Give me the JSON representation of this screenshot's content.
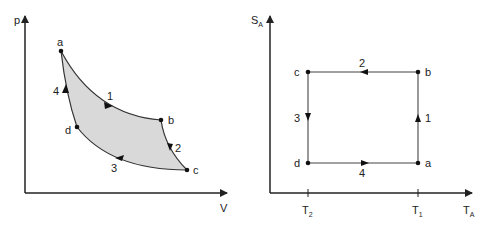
{
  "left_diagram": {
    "title": "p-V diagram",
    "y_axis_label": "p",
    "x_axis_label": "V",
    "points": {
      "a": {
        "label": "a"
      },
      "b": {
        "label": "b"
      },
      "c": {
        "label": "c"
      },
      "d": {
        "label": "d"
      }
    },
    "processes": [
      {
        "label": "1",
        "from": "a",
        "to": "b"
      },
      {
        "label": "2",
        "from": "b",
        "to": "c"
      },
      {
        "label": "3",
        "from": "c",
        "to": "d"
      },
      {
        "label": "4",
        "from": "d",
        "to": "a"
      }
    ],
    "fill_color": "#d9d9d9"
  },
  "right_diagram": {
    "title": "T-S diagram",
    "y_axis_label": "S",
    "y_axis_subscript": "A",
    "x_axis_label": "T",
    "x_axis_subscript": "A",
    "ticks": [
      {
        "label": "T",
        "subscript": "2"
      },
      {
        "label": "T",
        "subscript": "1"
      }
    ],
    "points": {
      "a": {
        "label": "a"
      },
      "b": {
        "label": "b"
      },
      "c": {
        "label": "c"
      },
      "d": {
        "label": "d"
      }
    },
    "processes": [
      {
        "label": "1",
        "from": "a",
        "to": "b"
      },
      {
        "label": "2",
        "from": "b",
        "to": "c"
      },
      {
        "label": "3",
        "from": "c",
        "to": "d"
      },
      {
        "label": "4",
        "from": "d",
        "to": "a"
      }
    ]
  },
  "colors": {
    "line": "#333333",
    "axis": "#222222",
    "fill": "#d9d9d9"
  }
}
